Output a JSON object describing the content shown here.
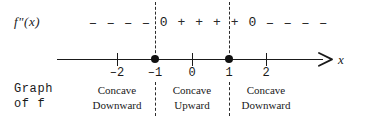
{
  "figure": {
    "row_label": "f\"(x)",
    "axis_variable": "x"
  },
  "sign_row": {
    "cells": [
      {
        "text": "–",
        "kind": "minus"
      },
      {
        "text": "–",
        "kind": "minus"
      },
      {
        "text": "–",
        "kind": "minus"
      },
      {
        "text": "–",
        "kind": "minus"
      },
      {
        "text": "0",
        "kind": "zero"
      },
      {
        "text": "+",
        "kind": "plus"
      },
      {
        "text": "+",
        "kind": "plus"
      },
      {
        "text": "+",
        "kind": "plus"
      },
      {
        "text": "+",
        "kind": "plus"
      },
      {
        "text": "0",
        "kind": "zero"
      },
      {
        "text": "–",
        "kind": "minus"
      },
      {
        "text": "–",
        "kind": "minus"
      },
      {
        "text": "–",
        "kind": "minus"
      },
      {
        "text": "–",
        "kind": "minus"
      }
    ]
  },
  "number_line": {
    "ticks": [
      {
        "value": -2,
        "label": "–2",
        "x": 117,
        "marker": "tick"
      },
      {
        "value": -1,
        "label": "–1",
        "x": 155,
        "marker": "dot"
      },
      {
        "value": 0,
        "label": "0",
        "x": 192,
        "marker": "tick"
      },
      {
        "value": 1,
        "label": "1",
        "x": 229,
        "marker": "dot"
      },
      {
        "value": 2,
        "label": "2",
        "x": 266,
        "marker": "tick"
      }
    ],
    "critical_points": [
      -1,
      1
    ]
  },
  "graph_label": "Graph\nof f",
  "regions": [
    {
      "line1": "Concave",
      "line2": "Downward",
      "center_x": 117,
      "interval": "x < –1"
    },
    {
      "line1": "Concave",
      "line2": "Upward",
      "center_x": 192,
      "interval": "–1 < x < 1"
    },
    {
      "line1": "Concave",
      "line2": "Downward",
      "center_x": 266,
      "interval": "x > 1"
    }
  ],
  "colors": {
    "ink": "#1a1a1a",
    "background": "#ffffff",
    "dashed": "#2b2b2b"
  },
  "chart_data": {
    "type": "line",
    "xlabel": "x",
    "ylabel": "",
    "xlim": [
      -2.6,
      3.2
    ],
    "grid": false,
    "categories": [
      "x < -1",
      "x = -1",
      "-1 < x < 1",
      "x = 1",
      "x > 1"
    ],
    "series": [
      {
        "name": "f\"(x) sign",
        "values": [
          "negative",
          "0",
          "positive",
          "0",
          "negative"
        ]
      },
      {
        "name": "concavity of f",
        "values": [
          "Concave Downward",
          "inflection",
          "Concave Upward",
          "inflection",
          "Concave Downward"
        ]
      }
    ],
    "x": [
      -2,
      -1,
      0,
      1,
      2
    ],
    "tick_labels": [
      "-2",
      "-1",
      "0",
      "1",
      "2"
    ],
    "annotations": [
      "f\"(x)",
      "Graph of f",
      "x"
    ]
  }
}
